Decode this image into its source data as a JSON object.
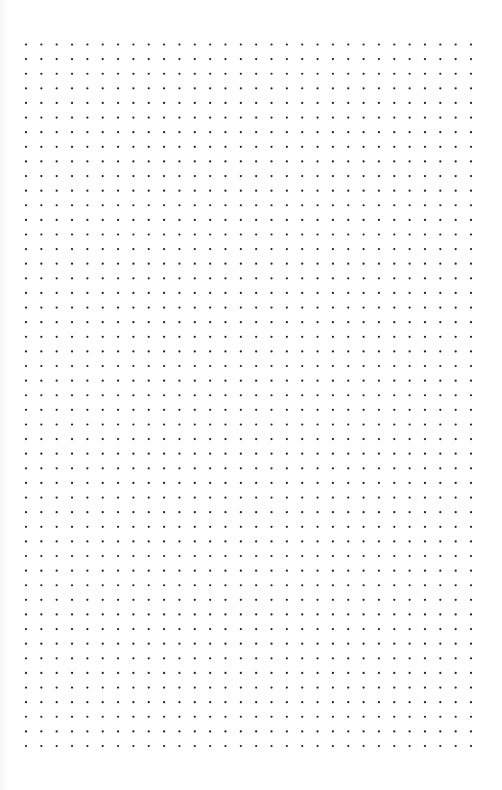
{
  "page": {
    "type": "dot-grid-paper",
    "background_color": "#fefefe",
    "dot_color": "#1e1e1e"
  },
  "grid": {
    "columns": 30,
    "rows": 49,
    "origin_x": 26,
    "origin_y": 44.5,
    "end_x": 471,
    "end_y": 746,
    "dot_radius": 1.1
  }
}
